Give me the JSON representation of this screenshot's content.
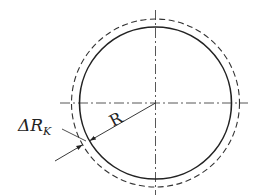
{
  "diagram": {
    "type": "geometry",
    "colors": {
      "stroke": "#222222",
      "background": "#ffffff"
    },
    "center": {
      "x": 155.5,
      "y": 103
    },
    "inner_circle": {
      "radius": 76,
      "style": "solid"
    },
    "outer_circle": {
      "radius": 84,
      "style": "dashed"
    },
    "centerlines": {
      "style": "dash-dot"
    },
    "labels": {
      "radius": "R",
      "delta_main": "ΔR",
      "delta_sub": "K"
    }
  }
}
